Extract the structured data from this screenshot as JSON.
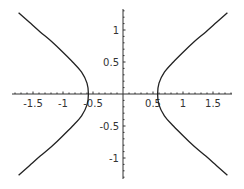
{
  "chart_data": {
    "type": "line",
    "title": "",
    "xlabel": "",
    "ylabel": "",
    "xlim": [
      -1.85,
      1.83
    ],
    "ylim": [
      -1.3,
      1.32
    ],
    "grid": false,
    "legend": null,
    "x_ticks": [
      -1.5,
      -1,
      -0.5,
      0.5,
      1,
      1.5
    ],
    "x_tick_labels": [
      "-1.5",
      "-1",
      "-0.5",
      "0.5",
      "1",
      "1.5"
    ],
    "y_ticks": [
      -1,
      -0.5,
      0.5,
      1
    ],
    "y_tick_labels": [
      "-1",
      "-0.5",
      "0.5",
      "1"
    ],
    "series": [
      {
        "name": "right branch",
        "x": [
          1.74,
          1.56,
          1.38,
          1.19,
          1.01,
          0.84,
          0.69,
          0.6,
          0.577,
          0.6,
          0.69,
          0.84,
          1.01,
          1.19,
          1.38,
          1.56,
          1.74
        ],
        "y": [
          1.27,
          1.12,
          0.97,
          0.82,
          0.66,
          0.5,
          0.34,
          0.17,
          0.0,
          -0.17,
          -0.34,
          -0.5,
          -0.66,
          -0.82,
          -0.97,
          -1.12,
          -1.27
        ]
      },
      {
        "name": "left branch",
        "x": [
          -1.74,
          -1.56,
          -1.38,
          -1.19,
          -1.01,
          -0.84,
          -0.69,
          -0.6,
          -0.577,
          -0.6,
          -0.69,
          -0.84,
          -1.01,
          -1.19,
          -1.38,
          -1.56,
          -1.74
        ],
        "y": [
          1.27,
          1.12,
          0.97,
          0.82,
          0.66,
          0.5,
          0.34,
          0.17,
          0.0,
          -0.17,
          -0.34,
          -0.5,
          -0.66,
          -0.82,
          -0.97,
          -1.12,
          -1.27
        ]
      }
    ]
  },
  "axes": {
    "x_labels": [
      "-1.5",
      "-1",
      "0.5",
      "0.5",
      "1",
      "1.5"
    ],
    "y_labels": [
      "1",
      "0.5",
      "-0.5",
      "-1"
    ]
  }
}
